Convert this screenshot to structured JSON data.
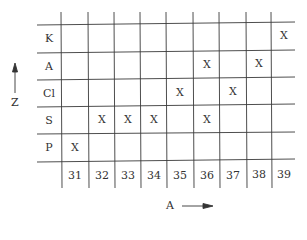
{
  "diagram": {
    "y_axis": {
      "label": "Z",
      "direction": "up"
    },
    "x_axis": {
      "label": "A",
      "direction": "right"
    },
    "rows": [
      "K",
      "A",
      "Cl",
      "S",
      "P"
    ],
    "columns": [
      "31",
      "32",
      "33",
      "34",
      "35",
      "36",
      "37",
      "38",
      "39"
    ],
    "mark_symbol": "X",
    "marks": {
      "K": [
        "39"
      ],
      "A": [
        "36",
        "38"
      ],
      "Cl": [
        "35",
        "37"
      ],
      "S": [
        "32",
        "33",
        "34",
        "36"
      ],
      "P": [
        "31"
      ]
    },
    "line_color": "#3a3a3a"
  }
}
